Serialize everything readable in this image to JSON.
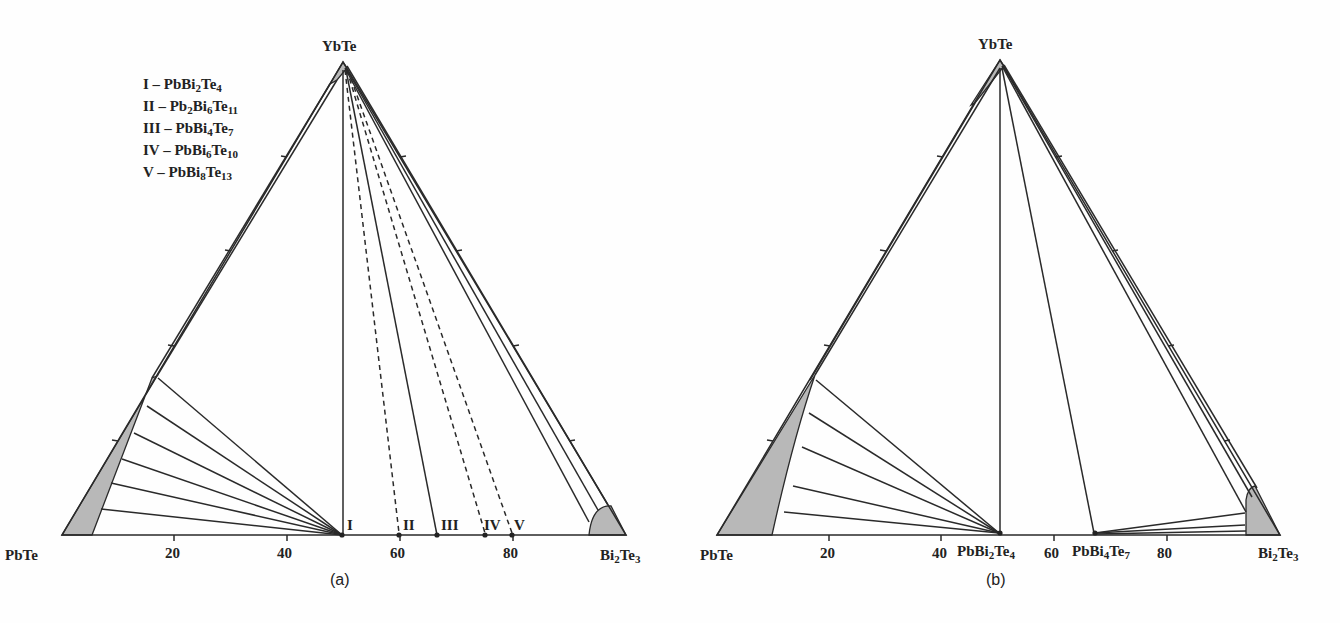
{
  "panel_a": {
    "caption": "(a)",
    "vertices": {
      "top": "YbTe",
      "left": "PbTe",
      "right": "Bi2Te3"
    },
    "axis_ticks": [
      "20",
      "40",
      "60",
      "80"
    ],
    "compound_marks": [
      "I",
      "II",
      "III",
      "IV",
      "V"
    ],
    "legend": [
      {
        "roman": "I",
        "sep": " – ",
        "formula": "PbBi2Te4"
      },
      {
        "roman": "II",
        "sep": " – ",
        "formula": "Pb2Bi6Te11"
      },
      {
        "roman": "III",
        "sep": " – ",
        "formula": "PbBi4Te7"
      },
      {
        "roman": "IV",
        "sep": " – ",
        "formula": "PbBi6Te10"
      },
      {
        "roman": "V",
        "sep": " – ",
        "formula": "PbBi8Te13"
      }
    ]
  },
  "panel_b": {
    "caption": "(b)",
    "vertices": {
      "top": "YbTe",
      "left": "PbTe",
      "right": "Bi2Te3"
    },
    "axis_ticks": [
      "20",
      "40",
      "60",
      "80"
    ],
    "compound_labels": [
      "PbBi2Te4",
      "PbBi4Te7"
    ]
  },
  "colors": {
    "line": "#2a2a2a",
    "phase_fill": "#b8b8b8",
    "background": "#fefefe"
  }
}
